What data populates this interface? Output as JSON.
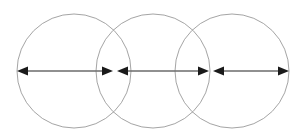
{
  "canvas": {
    "width": 302,
    "height": 138,
    "background_color": "#ffffff",
    "title": "Three overlapping circles with double-headed measurement arrows"
  },
  "style": {
    "circle_stroke_color": "#9a9a9a",
    "circle_stroke_width": 0.9,
    "circle_fill": "none",
    "arrow_line_color": "#6b6b6b",
    "arrow_line_width": 1.7,
    "arrow_head_color": "#1a1a1a",
    "arrow_head_length": 11,
    "arrow_head_half_width": 4.4
  },
  "chart_data": {
    "type": "diagram",
    "title": "Three overlapping circles with double-headed measurement arrows",
    "units": "pixels",
    "circle_count": 3,
    "arrow_count": 3,
    "common_radius": 57,
    "common_center_y": 71,
    "circles": [
      {
        "id": "circle-1",
        "label": "left-circle",
        "cx": 74,
        "cy": 71,
        "r": 57
      },
      {
        "id": "circle-2",
        "label": "middle-circle",
        "cx": 153,
        "cy": 71,
        "r": 57
      },
      {
        "id": "circle-3",
        "label": "right-circle",
        "cx": 232,
        "cy": 71,
        "r": 57
      }
    ],
    "center_spacing": 79,
    "arrows": [
      {
        "id": "arrow-1",
        "label": "left-span-arrow",
        "x1": 17,
        "x2": 113,
        "y": 71,
        "length": 96,
        "heads": "both"
      },
      {
        "id": "arrow-2",
        "label": "middle-span-arrow",
        "x1": 117,
        "x2": 209,
        "y": 71,
        "length": 92,
        "heads": "both"
      },
      {
        "id": "arrow-3",
        "label": "right-span-arrow",
        "x1": 213,
        "x2": 289,
        "y": 71,
        "length": 76,
        "heads": "both"
      }
    ],
    "intersection_points_x": [
      113.5,
      192.5
    ],
    "xlim": [
      0,
      302
    ],
    "ylim": [
      0,
      138
    ],
    "grid": false,
    "legend": false,
    "axis_labels": [],
    "tick_labels": [],
    "annotations": []
  }
}
